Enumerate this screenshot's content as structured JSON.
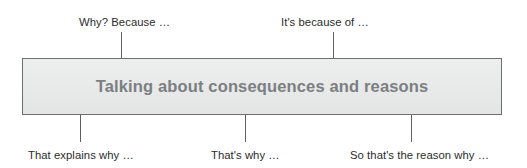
{
  "diagram": {
    "center_box": {
      "title": "Talking about consequences and reasons",
      "fill_color": "#e9eaea",
      "border_color": "#6e6e6e",
      "text_color": "#7b7f82"
    },
    "connector_color": "#5f5f5f",
    "label_color": "#2c2c2c",
    "top_callouts": [
      {
        "text": "Why? Because …"
      },
      {
        "text": "It's because of …"
      }
    ],
    "bottom_callouts": [
      {
        "text": "That explains why …"
      },
      {
        "text": "That's why …"
      },
      {
        "text": "So that's the reason why …"
      }
    ]
  }
}
